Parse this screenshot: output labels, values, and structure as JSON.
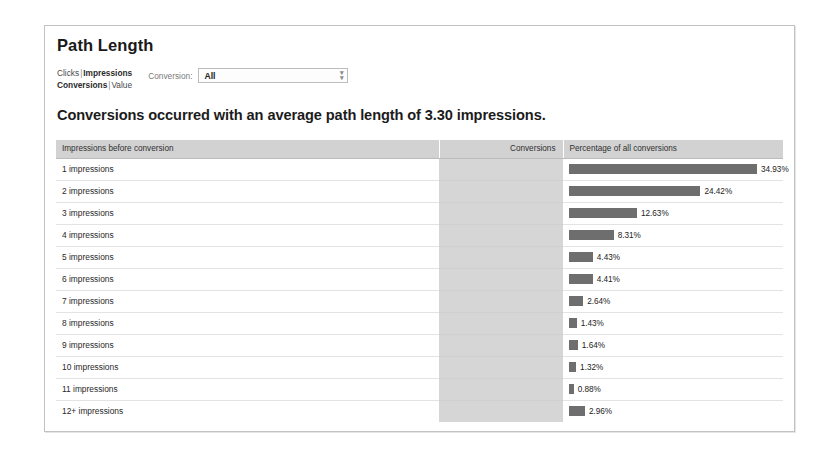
{
  "panel": {
    "title": "Path Length"
  },
  "controls": {
    "metric_links": [
      {
        "items": [
          {
            "label": "Clicks",
            "selected": false
          },
          {
            "label": "Impressions",
            "selected": true
          }
        ]
      },
      {
        "items": [
          {
            "label": "Conversions",
            "selected": true
          },
          {
            "label": "Value",
            "selected": false
          }
        ]
      }
    ],
    "separator": "|",
    "conversion_label": "Conversion:",
    "conversion_value": "All",
    "conversion_placeholder": "All",
    "conversion_options": [
      "All"
    ],
    "dropdown_icon": "chevron-double-down-icon"
  },
  "headline": "Conversions occurred with an average path length of 3.30 impressions.",
  "table": {
    "columns": [
      "Impressions before conversion",
      "Conversions",
      "Percentage of all conversions"
    ],
    "rows": [
      {
        "label": "1 impressions",
        "conversions": "",
        "percent_text": "34.93%",
        "percent": 34.93
      },
      {
        "label": "2 impressions",
        "conversions": "",
        "percent_text": "24.42%",
        "percent": 24.42
      },
      {
        "label": "3 impressions",
        "conversions": "",
        "percent_text": "12.63%",
        "percent": 12.63
      },
      {
        "label": "4 impressions",
        "conversions": "",
        "percent_text": "8.31%",
        "percent": 8.31
      },
      {
        "label": "5 impressions",
        "conversions": "",
        "percent_text": "4.43%",
        "percent": 4.43
      },
      {
        "label": "6 impressions",
        "conversions": "",
        "percent_text": "4.41%",
        "percent": 4.41
      },
      {
        "label": "7 impressions",
        "conversions": "",
        "percent_text": "2.64%",
        "percent": 2.64
      },
      {
        "label": "8 impressions",
        "conversions": "",
        "percent_text": "1.43%",
        "percent": 1.43
      },
      {
        "label": "9 impressions",
        "conversions": "",
        "percent_text": "1.64%",
        "percent": 1.64
      },
      {
        "label": "10 impressions",
        "conversions": "",
        "percent_text": "1.32%",
        "percent": 1.32
      },
      {
        "label": "11 impressions",
        "conversions": "",
        "percent_text": "0.88%",
        "percent": 0.88
      },
      {
        "label": "12+ impressions",
        "conversions": "",
        "percent_text": "2.96%",
        "percent": 2.96
      }
    ]
  },
  "chart_data": {
    "type": "bar",
    "title": "Conversions occurred with an average path length of 3.30 impressions.",
    "xlabel": "Percentage of all conversions",
    "ylabel": "Impressions before conversion",
    "orientation": "horizontal",
    "categories": [
      "1 impressions",
      "2 impressions",
      "3 impressions",
      "4 impressions",
      "5 impressions",
      "6 impressions",
      "7 impressions",
      "8 impressions",
      "9 impressions",
      "10 impressions",
      "11 impressions",
      "12+ impressions"
    ],
    "values": [
      34.93,
      24.42,
      12.63,
      8.31,
      4.43,
      4.41,
      2.64,
      1.43,
      1.64,
      1.32,
      0.88,
      2.96
    ],
    "value_labels": [
      "34.93%",
      "24.42%",
      "12.63%",
      "8.31%",
      "4.43%",
      "4.41%",
      "2.64%",
      "1.43%",
      "1.64%",
      "1.32%",
      "0.88%",
      "2.96%"
    ],
    "unit": "%",
    "xlim": [
      0,
      34.93
    ],
    "grid": false,
    "legend": false,
    "bar_color": "#6e6e6e",
    "average_path_length": 3.3
  },
  "colors": {
    "bar": "#6e6e6e",
    "header_bg": "#d2d2d2",
    "conversions_col_bg": "#d6d6d6",
    "panel_border": "#c2c2c2",
    "row_border": "#e3e3e3"
  },
  "scale": {
    "px_per_percent": 5.38
  }
}
